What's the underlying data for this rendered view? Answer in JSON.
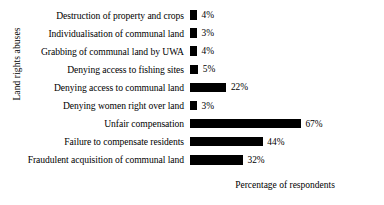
{
  "chart_data": {
    "type": "bar",
    "orientation": "horizontal",
    "title": "",
    "xlabel": "Percentage of respondents",
    "ylabel": "Land rights abuses",
    "grid": false,
    "legend": false,
    "xlim": [
      0,
      70
    ],
    "value_suffix": "%",
    "bar_color": "#000000",
    "categories": [
      "Destruction of property and crops",
      "Individualisation of communal land",
      "Grabbing of communal land by UWA",
      "Denying access to fishing sites",
      "Denying access to communal land",
      "Denying women right over land",
      "Unfair compensation",
      "Failure to compensate residents",
      "Fraudulent acquisition of communal land"
    ],
    "values": [
      4,
      3,
      4,
      5,
      22,
      3,
      67,
      44,
      32
    ],
    "value_labels": [
      "4%",
      "3%",
      "4%",
      "5%",
      "22%",
      "3%",
      "67%",
      "44%",
      "32%"
    ]
  }
}
